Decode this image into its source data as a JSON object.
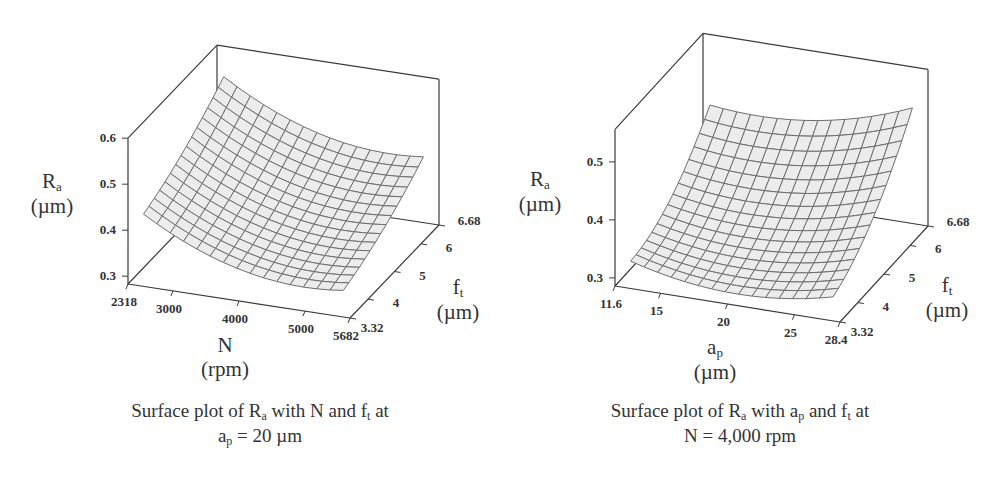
{
  "chart_data": [
    {
      "type": "surface",
      "title": "Surface plot of Ra with N and ft at ap = 20 µm",
      "caption_line1": {
        "pre": "Surface plot of R",
        "sub1": "a",
        "mid": " with N and f",
        "sub2": "t",
        "post": " at"
      },
      "caption_line2": {
        "pre": "a",
        "sub1": "p",
        "post": " = 20 µm"
      },
      "xlabel": "N",
      "xlabel_unit": "(rpm)",
      "ylabel": "f",
      "ylabel_sub": "t",
      "ylabel_unit": "(µm)",
      "zlabel": "R",
      "zlabel_sub": "a",
      "zlabel_unit": "(µm)",
      "x_range": [
        2318,
        5682
      ],
      "x_ticks": [
        "2318",
        "3000",
        "4000",
        "5000",
        "5682"
      ],
      "x_tick_values": [
        2318,
        3000,
        4000,
        5000,
        5682
      ],
      "y_range": [
        3.32,
        6.68
      ],
      "y_ticks": [
        "3.32",
        "4",
        "5",
        "6",
        "6.68"
      ],
      "y_tick_values": [
        3.32,
        4,
        5,
        6,
        6.68
      ],
      "z_range": [
        0.283,
        0.6
      ],
      "z_ticks": [
        "0.3",
        "0.4",
        "0.5",
        "0.6"
      ],
      "z_tick_values": [
        0.3,
        0.4,
        0.5,
        0.6
      ],
      "grid": 15,
      "corner_values": {
        "xmin_ymin": 0.44,
        "xmax_ymin": 0.33,
        "xmin_ymax": 0.57,
        "xmax_ymax": 0.45
      },
      "curvature_x": 0.05,
      "curvature_y": 0.03,
      "frame": {
        "origin": [
          128,
          284
        ],
        "x_end": [
          350,
          318
        ],
        "y_vec": [
          89,
          -93
        ],
        "z_px_per_unit": 460,
        "z_top": 0.6
      }
    },
    {
      "type": "surface",
      "title": "Surface plot of Ra with ap and ft at N = 4,000 rpm",
      "caption_line1": {
        "pre": "Surface plot of R",
        "sub1": "a",
        "mid": " with a",
        "sub2": "p",
        "mid2": " and f",
        "sub3": "t",
        "post": " at"
      },
      "caption_line2": {
        "pre": "N = 4,000 rpm"
      },
      "xlabel": "a",
      "xlabel_sub": "p",
      "xlabel_unit": "(µm)",
      "ylabel": "f",
      "ylabel_sub": "t",
      "ylabel_unit": "(µm)",
      "zlabel": "R",
      "zlabel_sub": "a",
      "zlabel_unit": "(µm)",
      "x_range": [
        11.6,
        28.4
      ],
      "x_ticks": [
        "11.6",
        "15",
        "20",
        "25",
        "28.4"
      ],
      "x_tick_values": [
        11.6,
        15,
        20,
        25,
        28.4
      ],
      "y_range": [
        3.32,
        6.68
      ],
      "y_ticks": [
        "3.32",
        "4",
        "5",
        "6",
        "6.68"
      ],
      "y_tick_values": [
        3.32,
        4,
        5,
        6,
        6.68
      ],
      "z_range": [
        0.286,
        0.556
      ],
      "z_ticks": [
        "0.3",
        "0.4",
        "0.5"
      ],
      "z_tick_labels_display": [
        "0.3",
        "0.4",
        "0.5"
      ],
      "z_tick_values": [
        0.3,
        0.4,
        0.5
      ],
      "grid": 15,
      "corner_values": {
        "xmin_ymin": 0.33,
        "xmax_ymin": 0.32,
        "xmin_ymax": 0.46,
        "xmax_ymax": 0.52
      },
      "curvature_x": 0.03,
      "curvature_y": 0.07,
      "frame": {
        "origin": [
          615,
          286
        ],
        "x_end": [
          840,
          322
        ],
        "y_vec": [
          88,
          -96
        ],
        "z_px_per_unit": 580,
        "z_top": 0.556
      }
    }
  ],
  "colors": {
    "surface_fill": "#ececec",
    "mesh_line": "#6e6e6e",
    "frame_line": "#3a3a3a",
    "text": "#333333"
  }
}
